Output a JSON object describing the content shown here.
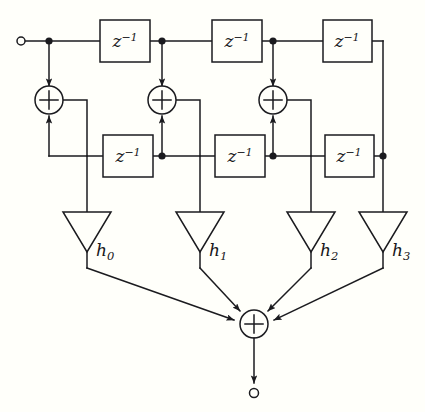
{
  "diagram": {
    "line_color": "#1b1b1f",
    "background_color": "#fffffa",
    "input_terminal": {
      "name": "input-node",
      "symbol": "o"
    },
    "output_terminal": {
      "name": "output-node",
      "symbol": "o"
    },
    "delay_blocks_top": [
      {
        "id": "z-top-0",
        "label_base": "z",
        "label_exp": "−1"
      },
      {
        "id": "z-top-1",
        "label_base": "z",
        "label_exp": "−1"
      },
      {
        "id": "z-top-2",
        "label_base": "z",
        "label_exp": "−1"
      }
    ],
    "delay_blocks_bottom": [
      {
        "id": "z-bot-0",
        "label_base": "z",
        "label_exp": "−1"
      },
      {
        "id": "z-bot-1",
        "label_base": "z",
        "label_exp": "−1"
      },
      {
        "id": "z-bot-2",
        "label_base": "z",
        "label_exp": "−1"
      }
    ],
    "adders": [
      {
        "id": "adder-0",
        "symbol": "+"
      },
      {
        "id": "adder-1",
        "symbol": "+"
      },
      {
        "id": "adder-2",
        "symbol": "+"
      },
      {
        "id": "adder-out",
        "symbol": "+"
      }
    ],
    "gains": [
      {
        "id": "gain-h0",
        "base": "h",
        "sub": "0"
      },
      {
        "id": "gain-h1",
        "base": "h",
        "sub": "1"
      },
      {
        "id": "gain-h2",
        "base": "h",
        "sub": "2"
      },
      {
        "id": "gain-h3",
        "base": "h",
        "sub": "3"
      }
    ]
  }
}
